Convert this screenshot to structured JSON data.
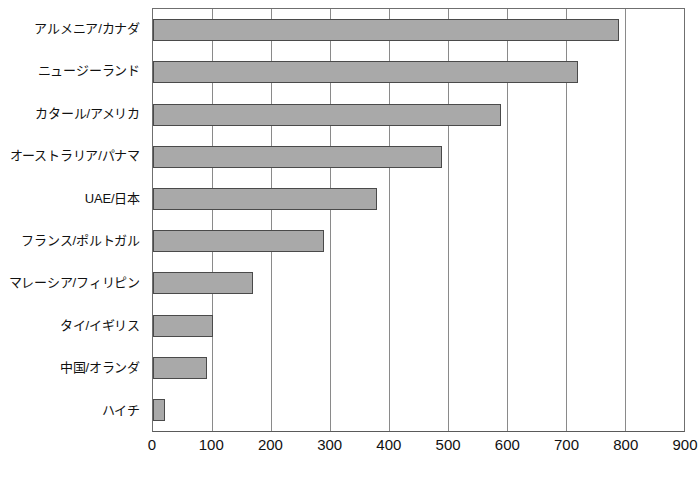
{
  "chart_data": {
    "type": "bar",
    "orientation": "horizontal",
    "title": "",
    "subtitle": "",
    "xlabel": "",
    "ylabel": "",
    "categories": [
      "アルメニア/カナダ",
      "ニュージーランド",
      "カタール/アメリカ",
      "オーストラリア/パナマ",
      "UAE/日本",
      "フランス/ポルトガル",
      "マレーシア/フィリピン",
      "タイ/イギリス",
      "中国/オランダ",
      "ハイチ"
    ],
    "values": [
      790,
      720,
      590,
      490,
      380,
      290,
      170,
      102,
      92,
      20
    ],
    "xlim": [
      0,
      900
    ],
    "xticks": [
      0,
      100,
      200,
      300,
      400,
      500,
      600,
      700,
      800,
      900
    ],
    "xtick_labels": [
      "0",
      "100",
      "200",
      "300",
      "400",
      "500",
      "600",
      "700",
      "800",
      "900"
    ],
    "grid": "vertical",
    "legend": "none",
    "bar_fill_color": "#a9a9a9",
    "bar_border_color": "#4a4a4a",
    "gridline_color": "#8a8a8a",
    "axis_color": "#5a5a5a",
    "background_color": "#ffffff"
  }
}
